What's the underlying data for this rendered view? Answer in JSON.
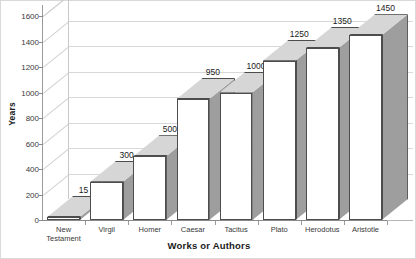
{
  "chart_data": {
    "type": "bar",
    "title": "",
    "subtitle": "",
    "xlabel": "Works or Authors",
    "ylabel": "Years",
    "categories": [
      "New\nTestament",
      "Virgil",
      "Homer",
      "Caesar",
      "Tacitus",
      "Plato",
      "Herodotus",
      "Aristotle"
    ],
    "values": [
      15,
      300,
      500,
      950,
      1000,
      1250,
      1350,
      1450
    ],
    "data_labels": [
      "15",
      "300",
      "500",
      "950",
      "1000",
      "1250",
      "1350",
      "1450"
    ],
    "ylim": [
      0,
      1600
    ],
    "ytick_labels": [
      "0",
      "200",
      "400",
      "600",
      "800",
      "1000",
      "1200",
      "1400",
      "1600"
    ],
    "ytick_values": [
      0,
      200,
      400,
      600,
      800,
      1000,
      1200,
      1400,
      1600
    ],
    "grid": true,
    "legend": "none",
    "style": "3d-column",
    "colors": {
      "bar_front": "#ffffff",
      "bar_top": "#d6d6d6",
      "bar_side": "#9e9e9e",
      "bar_outline": "#4d4d4d",
      "gridline": "#d0d0d0",
      "axis": "#9a9a9a",
      "text": "#1a1a1a",
      "background": "#ffffff",
      "border": "#d9d9d9"
    }
  }
}
